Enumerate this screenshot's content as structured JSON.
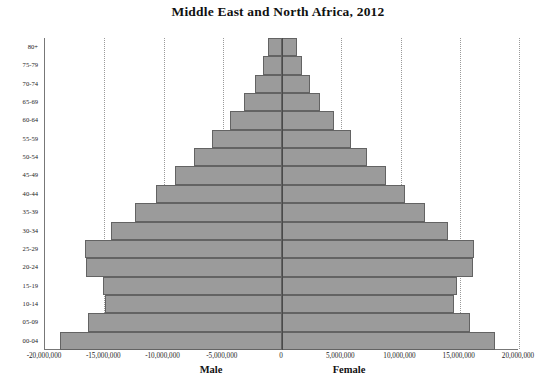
{
  "chart_data": {
    "type": "bar",
    "subtype": "population-pyramid",
    "title": "Middle East and North Africa, 2012",
    "xlabel": "",
    "ylabel": "",
    "grid": true,
    "legend_position": "bottom",
    "orientation": "horizontal",
    "categories": [
      "80+",
      "75-79",
      "70-74",
      "65-69",
      "60-64",
      "55-59",
      "50-54",
      "45-49",
      "40-44",
      "35-39",
      "30-34",
      "25-29",
      "20-24",
      "15-19",
      "10-14",
      "05-09",
      "00-04"
    ],
    "xlim": [
      -20000000,
      20000000
    ],
    "xticks": [
      -20000000,
      -15000000,
      -10000000,
      -5000000,
      0,
      5000000,
      10000000,
      15000000,
      20000000
    ],
    "xticklabels": [
      "-20,000,000",
      "-15,000,000",
      "-10,000,000",
      "-5,000,000",
      "0",
      "5,000,000",
      "10,000,000",
      "15,000,000",
      "20,000,000"
    ],
    "series": [
      {
        "name": "Male",
        "sign": "negative",
        "values": [
          -1150000,
          -1600000,
          -2300000,
          -3200000,
          -4400000,
          -5900000,
          -7400000,
          -9000000,
          -10600000,
          -12400000,
          -14400000,
          -16600000,
          -16500000,
          -15100000,
          -14900000,
          -16400000,
          -18700000
        ]
      },
      {
        "name": "Female",
        "sign": "positive",
        "values": [
          1250000,
          1650000,
          2350000,
          3200000,
          4400000,
          5800000,
          7200000,
          8800000,
          10400000,
          12100000,
          14000000,
          16200000,
          16100000,
          14800000,
          14500000,
          15900000,
          18000000
        ]
      }
    ]
  },
  "axes": {
    "male_label": "Male",
    "female_label": "Female"
  },
  "style": {
    "bar_fill": "#9b9b9b",
    "bar_stroke": "#636363",
    "gridline_color": "#9a9a9a",
    "axis_color": "#777777",
    "center_axis_color": "#4a4a4a",
    "text_color": "#1c1c1c",
    "background": "#ffffff"
  }
}
